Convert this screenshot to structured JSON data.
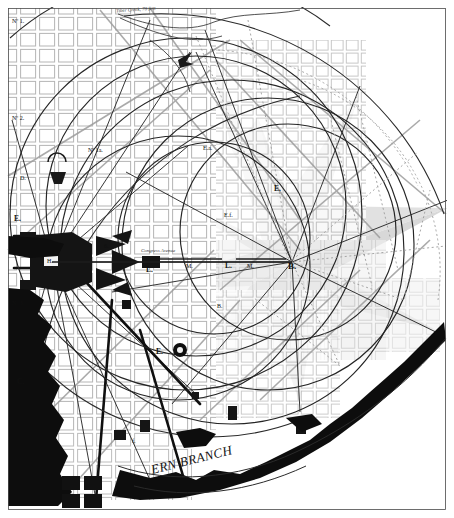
{
  "map": {
    "title": "Plan of the City of Washington",
    "frame": {
      "border_color": "#2b2b2b",
      "background_color": "#ffffff"
    },
    "palette": {
      "ink": "#1a1a1a",
      "grid_light": "#b9b9b9",
      "grid_mid": "#8d8d8d",
      "shade_light": "#e3e3e3",
      "shade_mid": "#cfcfcf",
      "shade_dark": "#b4b4b4",
      "water_dark": "#0d0d0d",
      "circle_line": "#262626",
      "dotted_line": "#9a9a9a"
    },
    "annotations": {
      "creek_note": "Tiber Creek, 78 feet",
      "congress_avenue": "Congress Avenue",
      "river_eastern_branch": "ERN BRANCH"
    },
    "point_labels": [
      {
        "id": "no1",
        "text": "Nº 1.",
        "x": 12,
        "y": 18,
        "size": "lbl-sm"
      },
      {
        "id": "no2",
        "text": "Nº 2.",
        "x": 12,
        "y": 115,
        "size": "lbl-sm"
      },
      {
        "id": "d",
        "text": "D.",
        "x": 20,
        "y": 175,
        "size": "lbl-sm"
      },
      {
        "id": "e-left",
        "text": "E.",
        "x": 14,
        "y": 215,
        "size": "lbl-md"
      },
      {
        "id": "h",
        "text": "H.",
        "x": 47,
        "y": 258,
        "size": "lbl-sm"
      },
      {
        "id": "no3",
        "text": "Nº 3.",
        "x": 12,
        "y": 300,
        "size": "lbl-sm"
      },
      {
        "id": "c",
        "text": "C.",
        "x": 17,
        "y": 378,
        "size": "lbl-md"
      },
      {
        "id": "no1a",
        "text": "Nº 1a.",
        "x": 88,
        "y": 147,
        "size": "lbl-sm"
      },
      {
        "id": "six",
        "text": "6.",
        "x": 104,
        "y": 243,
        "size": "lbl-sm"
      },
      {
        "id": "l1",
        "text": "L.",
        "x": 146,
        "y": 266,
        "size": "lbl-md"
      },
      {
        "id": "m1",
        "text": "M.",
        "x": 186,
        "y": 263,
        "size": "lbl-sm"
      },
      {
        "id": "l2",
        "text": "L.",
        "x": 225,
        "y": 262,
        "size": "lbl-md"
      },
      {
        "id": "m2",
        "text": "M.",
        "x": 247,
        "y": 263,
        "size": "lbl-sm"
      },
      {
        "id": "b",
        "text": "B.",
        "x": 288,
        "y": 262,
        "size": "lbl-lg"
      },
      {
        "id": "e-right",
        "text": "E.",
        "x": 274,
        "y": 185,
        "size": "lbl-md"
      },
      {
        "id": "ea",
        "text": "E.a.",
        "x": 203,
        "y": 145,
        "size": "lbl-sm"
      },
      {
        "id": "ef",
        "text": "E.f.",
        "x": 224,
        "y": 212,
        "size": "lbl-sm"
      },
      {
        "id": "bk",
        "text": "B.",
        "x": 217,
        "y": 303,
        "size": "lbl-sm"
      },
      {
        "id": "e-low",
        "text": "E.",
        "x": 156,
        "y": 348,
        "size": "lbl-md"
      },
      {
        "id": "f-low",
        "text": "f.",
        "x": 132,
        "y": 438,
        "size": "lbl-sm"
      }
    ]
  }
}
